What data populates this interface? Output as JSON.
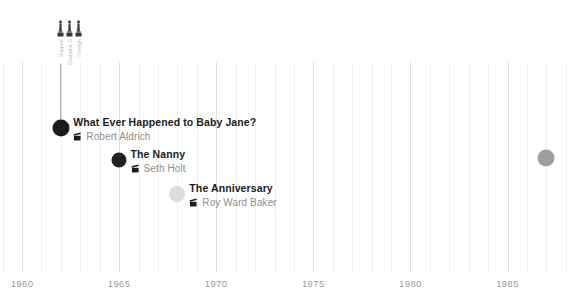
{
  "chart_data": {
    "type": "timeline",
    "title": "",
    "xlabel": "",
    "ylabel": "",
    "xlim": [
      1959,
      1988.5
    ],
    "grid": true,
    "minor_grid_step": 1,
    "major_grid_step": 5,
    "legend": "none",
    "axis_ticks": [
      {
        "label": "1960",
        "value": 1960
      },
      {
        "label": "1965",
        "value": 1965
      },
      {
        "label": "1970",
        "value": 1970
      },
      {
        "label": "1975",
        "value": 1975
      },
      {
        "label": "1980",
        "value": 1980
      },
      {
        "label": "1985",
        "value": 1985
      }
    ],
    "points": [
      {
        "title": "What Ever Happened to Baby Jane?",
        "director": "Robert Aldrich",
        "year": 1962,
        "dot_size": 17,
        "dot_color": "#1b1b1b",
        "label_align": "left",
        "has_stem": true,
        "awards": [
          {
            "icon": "oscar-statuette-icon",
            "name": "Support"
          },
          {
            "icon": "oscar-statuette-icon",
            "name": "Costume Design"
          },
          {
            "icon": "oscar-statuette-icon",
            "name": "Foreign"
          }
        ]
      },
      {
        "title": "The Nanny",
        "director": "Seth Holt",
        "year": 1965,
        "dot_size": 15,
        "dot_color": "#212121",
        "label_align": "left",
        "has_stem": false,
        "awards": []
      },
      {
        "title": "The Anniversary",
        "director": "Roy Ward Baker",
        "year": 1968,
        "dot_size": 16,
        "dot_color": "#dcdcdc",
        "label_align": "left",
        "has_stem": false,
        "awards": []
      },
      {
        "title": "The Whales of August",
        "director": "Lindsay Anderson",
        "year": 1987,
        "dot_size": 17,
        "dot_color": "#9e9e9e",
        "label_align": "right",
        "has_stem": false,
        "awards": []
      }
    ]
  },
  "colors": {
    "background": "#ffffff",
    "gridline_minor": "#f0f0f0",
    "gridline_major": "#dedede",
    "title_text": "#1b1b1b",
    "director_text": "#8d8d8d",
    "axis_text": "#9a9a9a",
    "stem": "#9e9e9e",
    "award_label": "#b4b4b4"
  }
}
